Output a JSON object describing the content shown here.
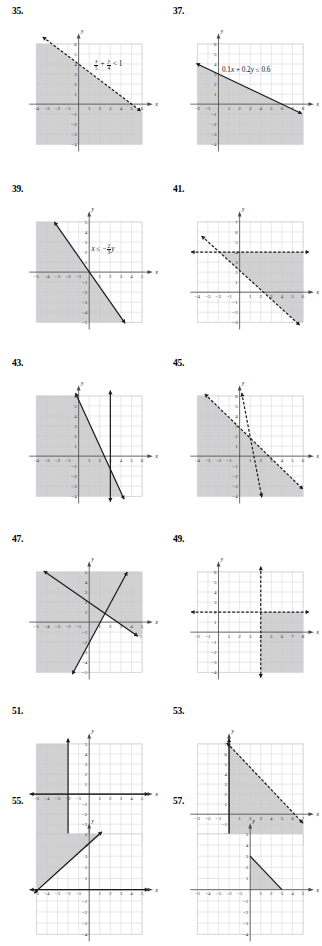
{
  "page": {
    "width": 322,
    "height": 924,
    "background": "#ffffff",
    "style": "textbook answer key — graphs of linear inequalities"
  },
  "theme": {
    "grid_line": "#c9cbd2",
    "grid_fill": "#ffffff",
    "shade_fill": "#c9c9c9",
    "axis": "#4a4a4a",
    "line": "#1a1a1a",
    "tick_text": "#2b2b2b",
    "number_text": "#000000"
  },
  "exercises": [
    {
      "number": "35.",
      "col": 0,
      "row": 0,
      "equation_html": "x/5 + y/4 < 1",
      "line_style": "dashed",
      "shaded": "below-left",
      "axis": {
        "xmin": -4,
        "xmax": 6,
        "ymin": -4,
        "ymax": 6
      },
      "x_ticks": [
        "-4",
        "-3",
        "-2",
        "-1",
        "1",
        "2",
        "3",
        "4",
        "5",
        "6"
      ],
      "y_ticks": [
        "6",
        "5",
        "4",
        "3",
        "2",
        "1",
        "-1",
        "-2",
        "-3",
        "-4"
      ],
      "x_axis_label": "x",
      "y_axis_label": "y",
      "lines": [
        {
          "kind": "segment",
          "x1": -3.4,
          "y1": 6.7,
          "x2": 5.9,
          "y2": -0.7,
          "dashed": true,
          "arrows": "both"
        }
      ]
    },
    {
      "number": "37.",
      "col": 1,
      "row": 0,
      "equation_html": "0.1x + 0.2y ≤ 0.6",
      "line_style": "solid",
      "shaded": "below-left",
      "axis": {
        "xmin": -2,
        "xmax": 8,
        "ymin": -4,
        "ymax": 6
      },
      "x_ticks": [
        "-2",
        "-1",
        "1",
        "2",
        "3",
        "4",
        "5",
        "6",
        "7",
        "8"
      ],
      "y_ticks": [
        "6",
        "5",
        "4",
        "3",
        "2",
        "1",
        "-1",
        "-2",
        "-3",
        "-4"
      ],
      "x_axis_label": "x",
      "y_axis_label": "y",
      "lines": [
        {
          "kind": "segment",
          "x1": -2.1,
          "y1": 4.05,
          "x2": 7.9,
          "y2": -0.95,
          "dashed": false,
          "arrows": "both"
        }
      ]
    },
    {
      "number": "39.",
      "col": 0,
      "row": 1,
      "equation_html": "x ≤ -2/3 y",
      "line_style": "solid",
      "shaded": "left",
      "axis": {
        "xmin": -5,
        "xmax": 5,
        "ymin": -5,
        "ymax": 5
      },
      "x_ticks": [
        "-5",
        "-4",
        "-3",
        "-2",
        "-1",
        "1",
        "2",
        "3",
        "4",
        "5"
      ],
      "y_ticks": [
        "5",
        "4",
        "3",
        "2",
        "1",
        "-1",
        "-2",
        "-3",
        "-4",
        "-5"
      ],
      "x_axis_label": "x",
      "y_axis_label": "y",
      "lines": [
        {
          "kind": "segment",
          "x1": -3.3,
          "y1": 5.0,
          "x2": 3.4,
          "y2": -5.1,
          "dashed": false,
          "arrows": "both"
        }
      ]
    },
    {
      "number": "41.",
      "col": 1,
      "row": 1,
      "equation_html": "",
      "line_style": "dashed",
      "shaded": "quadrant-right-below",
      "axis": {
        "xmin": -4,
        "xmax": 6,
        "ymin": -3,
        "ymax": 7
      },
      "x_ticks": [
        "-4",
        "-3",
        "-2",
        "-1",
        "1",
        "2",
        "3",
        "4",
        "5",
        "6"
      ],
      "y_ticks": [
        "7",
        "6",
        "5",
        "4",
        "3",
        "2",
        "1",
        "-1",
        "-2",
        "-3"
      ],
      "x_axis_label": "x",
      "y_axis_label": "y",
      "lines": [
        {
          "kind": "horizontal",
          "y": 4,
          "dashed": true,
          "arrows": "both"
        },
        {
          "kind": "segment",
          "x1": -3.6,
          "y1": 5.6,
          "x2": 5.7,
          "y2": -3.3,
          "dashed": true,
          "arrows": "both"
        }
      ]
    },
    {
      "number": "43.",
      "col": 0,
      "row": 2,
      "equation_html": "",
      "line_style": "solid",
      "shaded": "left-of-vertical",
      "axis": {
        "xmin": -4,
        "xmax": 6,
        "ymin": -4,
        "ymax": 6
      },
      "x_ticks": [
        "-4",
        "-3",
        "-2",
        "-1",
        "1",
        "2",
        "3",
        "4",
        "5",
        "6"
      ],
      "y_ticks": [
        "6",
        "5",
        "4",
        "3",
        "2",
        "1",
        "-1",
        "-2",
        "-3",
        "-4"
      ],
      "x_axis_label": "x",
      "y_axis_label": "y",
      "lines": [
        {
          "kind": "vertical",
          "x": 3,
          "dashed": false,
          "arrows": "both"
        },
        {
          "kind": "segment",
          "x1": -0.3,
          "y1": 6.3,
          "x2": 4.3,
          "y2": -4.3,
          "dashed": false,
          "arrows": "both"
        }
      ]
    },
    {
      "number": "45.",
      "col": 1,
      "row": 2,
      "equation_html": "",
      "line_style": "dashed",
      "shaded": "below-left",
      "axis": {
        "xmin": -4,
        "xmax": 6,
        "ymin": -4,
        "ymax": 6
      },
      "x_ticks": [
        "-4",
        "-3",
        "-2",
        "-1",
        "1",
        "2",
        "3",
        "4",
        "5",
        "6"
      ],
      "y_ticks": [
        "6",
        "5",
        "4",
        "3",
        "2",
        "1",
        "-1",
        "-2",
        "-3",
        "-4"
      ],
      "x_axis_label": "x",
      "y_axis_label": "y",
      "lines": [
        {
          "kind": "segment",
          "x1": -3.3,
          "y1": 6.2,
          "x2": 6.0,
          "y2": -3.3,
          "dashed": true,
          "arrows": "both"
        },
        {
          "kind": "segment",
          "x1": 0.2,
          "y1": 6.3,
          "x2": 2.1,
          "y2": -4.1,
          "dashed": true,
          "arrows": "both"
        }
      ]
    },
    {
      "number": "47.",
      "col": 0,
      "row": 3,
      "equation_html": "",
      "line_style": "solid",
      "shaded": "upper-left-wedge",
      "axis": {
        "xmin": -5,
        "xmax": 5,
        "ymin": -5,
        "ymax": 5
      },
      "x_ticks": [
        "-5",
        "-4",
        "-3",
        "-2",
        "-1",
        "1",
        "2",
        "3",
        "4",
        "5"
      ],
      "y_ticks": [
        "5",
        "4",
        "3",
        "2",
        "1",
        "-1",
        "-2",
        "-3",
        "-4",
        "-5"
      ],
      "x_axis_label": "x",
      "y_axis_label": "y",
      "lines": [
        {
          "kind": "segment",
          "x1": -4.3,
          "y1": 5.1,
          "x2": 4.6,
          "y2": -1.4,
          "dashed": false,
          "arrows": "both"
        },
        {
          "kind": "segment",
          "x1": -1.6,
          "y1": -5.2,
          "x2": 3.6,
          "y2": 5.0,
          "dashed": false,
          "arrows": "both"
        }
      ]
    },
    {
      "number": "49.",
      "col": 1,
      "row": 3,
      "equation_html": "",
      "line_style": "dashed",
      "shaded": "lower-right",
      "axis": {
        "xmin": -2,
        "xmax": 8,
        "ymin": -4,
        "ymax": 6
      },
      "x_ticks": [
        "-2",
        "-1",
        "1",
        "2",
        "3",
        "4",
        "5",
        "6",
        "7",
        "8"
      ],
      "y_ticks": [
        "6",
        "5",
        "4",
        "3",
        "2",
        "1",
        "-1",
        "-2",
        "-3",
        "-4"
      ],
      "x_axis_label": "x",
      "y_axis_label": "y",
      "lines": [
        {
          "kind": "vertical",
          "x": 4,
          "dashed": true,
          "arrows": "both"
        },
        {
          "kind": "horizontal",
          "y": 2,
          "dashed": true,
          "arrows": "both"
        }
      ]
    },
    {
      "number": "51.",
      "col": 0,
      "row": 4,
      "equation_html": "",
      "line_style": "solid",
      "shaded": "left-half",
      "axis": {
        "xmin": -5,
        "xmax": 5,
        "ymin": -5,
        "ymax": 5
      },
      "x_ticks": [
        "-5",
        "-4",
        "-3",
        "-2",
        "-1",
        "1",
        "2",
        "3",
        "4",
        "5"
      ],
      "y_ticks": [
        "5",
        "4",
        "3",
        "2",
        "1",
        "-1",
        "-2",
        "-3",
        "-4",
        "-5"
      ],
      "x_axis_label": "x",
      "y_axis_label": "y",
      "lines": [
        {
          "kind": "vertical",
          "x": -2,
          "dashed": false,
          "arrows": "both"
        },
        {
          "kind": "horizontal",
          "y": 0,
          "dashed": false,
          "arrows": "both"
        }
      ]
    },
    {
      "number": "53.",
      "col": 1,
      "row": 4,
      "equation_html": "",
      "line_style": "mixed",
      "shaded": "triangle-right",
      "axis": {
        "xmin": -3,
        "xmax": 7,
        "ymin": -3,
        "ymax": 7
      },
      "x_ticks": [
        "-3",
        "-2",
        "-1",
        "1",
        "2",
        "3",
        "4",
        "5",
        "6",
        "7"
      ],
      "y_ticks": [
        "7",
        "6",
        "5",
        "4",
        "3",
        "2",
        "1",
        "-1",
        "-2",
        "-3"
      ],
      "x_axis_label": "x",
      "y_axis_label": "y",
      "lines": [
        {
          "kind": "vertical",
          "x": 0,
          "dashed": false,
          "arrows": "both"
        },
        {
          "kind": "segment",
          "x1": -0.2,
          "y1": 7.1,
          "x2": 7.0,
          "y2": -0.9,
          "dashed": true,
          "arrows": "both"
        }
      ]
    },
    {
      "number": "55.",
      "col": 0,
      "row": 5,
      "equation_html": "",
      "line_style": "solid",
      "shaded": "upper-left",
      "axis": {
        "xmin": -5,
        "xmax": 5,
        "ymin": -4,
        "ymax": 5
      },
      "x_ticks": [
        "-5",
        "-4",
        "-3",
        "-2",
        "-1",
        "1",
        "2",
        "3",
        "4",
        "5"
      ],
      "y_ticks": [
        "5",
        "4",
        "3",
        "2",
        "1",
        "-1",
        "-2",
        "-3",
        "-4"
      ],
      "x_axis_label": "x",
      "y_axis_label": "y",
      "lines": [
        {
          "kind": "segment",
          "x1": -5.2,
          "y1": -0.3,
          "x2": 1.2,
          "y2": 5.2,
          "dashed": false,
          "arrows": "both"
        },
        {
          "kind": "horizontal",
          "y": 0,
          "dashed": false,
          "arrows": "both"
        }
      ]
    },
    {
      "number": "57.",
      "col": 1,
      "row": 5,
      "equation_html": "",
      "line_style": "solid",
      "shaded": "triangle-origin",
      "axis": {
        "xmin": -5,
        "xmax": 5,
        "ymin": -4,
        "ymax": 5
      },
      "x_ticks": [
        "-5",
        "-4",
        "-3",
        "-2",
        "-1",
        "1",
        "2",
        "3",
        "4",
        "5"
      ],
      "y_ticks": [
        "5",
        "4",
        "3",
        "2",
        "1",
        "-1",
        "-2",
        "-3",
        "-4"
      ],
      "x_axis_label": "x",
      "y_axis_label": "y",
      "lines": [
        {
          "kind": "segment",
          "x1": 0,
          "y1": 3,
          "x2": 3,
          "y2": 0,
          "dashed": false,
          "arrows": "none"
        }
      ]
    }
  ]
}
